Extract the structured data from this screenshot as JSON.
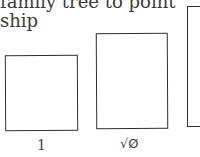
{
  "text": {
    "line1": "family tree to point",
    "line2": "ship"
  },
  "boxes": [
    {
      "label": "1"
    },
    {
      "label": "√Ø"
    },
    {
      "label": ""
    }
  ]
}
